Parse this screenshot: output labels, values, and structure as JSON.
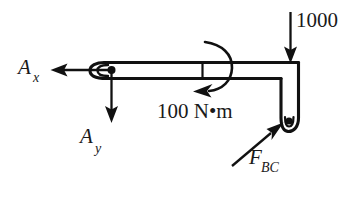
{
  "figure": {
    "type": "free-body-diagram",
    "background_color": "#ffffff",
    "line_color": "#111111",
    "text_color": "#1a1a1a"
  },
  "labels": {
    "reaction_x": {
      "symbol": "A",
      "subscript": "x"
    },
    "reaction_y": {
      "symbol": "A",
      "subscript": "y"
    },
    "applied_load": {
      "value": "1000"
    },
    "applied_moment": {
      "value": "100 N•m"
    },
    "link_force": {
      "symbol": "F",
      "subscript": "BC"
    }
  },
  "members": {
    "horizontal_beam": {
      "name": "beam-AB"
    },
    "vertical_member": {
      "name": "member-BC"
    },
    "pin_a": {
      "name": "pin-joint-a"
    },
    "pin_c": {
      "name": "pin-joint-c"
    }
  },
  "forces": [
    {
      "name": "A_x",
      "direction": "left",
      "label": "A"
    },
    {
      "name": "A_y",
      "direction": "down",
      "label": "A"
    },
    {
      "name": "1000",
      "direction": "down",
      "label": "1000"
    },
    {
      "name": "F_BC",
      "direction": "up-right",
      "label": "F"
    }
  ],
  "moments": [
    {
      "name": "100 N•m",
      "sense": "counterclockwise",
      "label": "100 N•m"
    }
  ]
}
